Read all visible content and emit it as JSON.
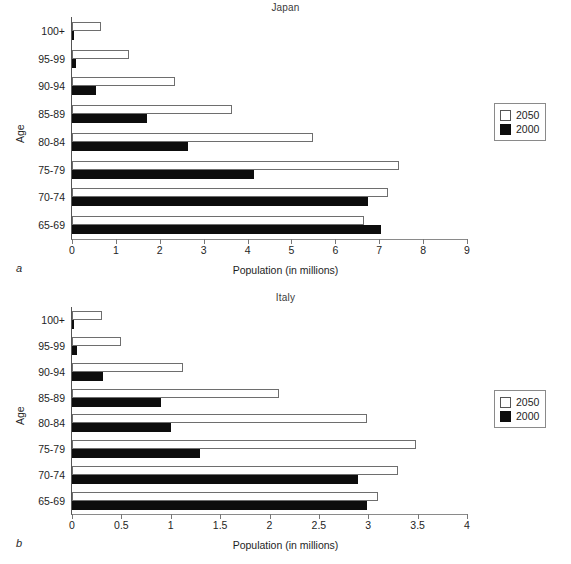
{
  "figure": {
    "panel_a_letter": "a",
    "panel_b_letter": "b"
  },
  "chart_data": [
    {
      "type": "bar",
      "orientation": "horizontal",
      "title": "Japan",
      "xlabel": "Population (in millions)",
      "ylabel": "Age",
      "categories": [
        "65-69",
        "70-74",
        "75-79",
        "80-84",
        "85-89",
        "90-94",
        "95-99",
        "100+"
      ],
      "series": [
        {
          "name": "2050",
          "color": "#ffffff",
          "values": [
            6.65,
            7.2,
            7.45,
            5.5,
            3.65,
            2.35,
            1.3,
            0.65
          ]
        },
        {
          "name": "2000",
          "color": "#0d0d0d",
          "values": [
            7.05,
            6.75,
            4.15,
            2.65,
            1.7,
            0.55,
            0.1,
            0.05
          ]
        }
      ],
      "xlim": [
        0,
        9
      ],
      "xticks": [
        0,
        1,
        2,
        3,
        4,
        5,
        6,
        7,
        8,
        9
      ],
      "xtick_labels": [
        "0",
        "1",
        "2",
        "3",
        "4",
        "5",
        "6",
        "7",
        "8",
        "9"
      ],
      "grid": false,
      "legend_position": "right-outside"
    },
    {
      "type": "bar",
      "orientation": "horizontal",
      "title": "Italy",
      "xlabel": "Population (in millions)",
      "ylabel": "Age",
      "categories": [
        "65-69",
        "70-74",
        "75-79",
        "80-84",
        "85-89",
        "90-94",
        "95-99",
        "100+"
      ],
      "series": [
        {
          "name": "2050",
          "color": "#ffffff",
          "values": [
            3.1,
            3.3,
            3.48,
            2.99,
            2.1,
            1.12,
            0.5,
            0.3
          ]
        },
        {
          "name": "2000",
          "color": "#0d0d0d",
          "values": [
            2.99,
            2.9,
            1.3,
            1.0,
            0.9,
            0.31,
            0.05,
            0.02
          ]
        }
      ],
      "xlim": [
        0,
        4
      ],
      "xticks": [
        0,
        0.5,
        1,
        1.5,
        2,
        2.5,
        3,
        3.5,
        4
      ],
      "xtick_labels": [
        "0",
        "0.5",
        "1",
        "1.5",
        "2",
        "2.5",
        "3",
        "3.5",
        "4"
      ],
      "grid": false,
      "legend_position": "right-outside"
    }
  ]
}
